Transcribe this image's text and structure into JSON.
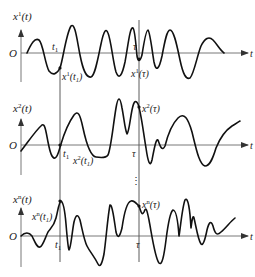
{
  "panels": [
    {
      "ylabel": "x",
      "ylabel_sup": "1",
      "ylabel_arg": "(t)",
      "origin": "O",
      "xaxis": "t",
      "t1_label": "t",
      "t1_sub": "1",
      "tau_label": "τ",
      "value_t1": "x",
      "value_t1_sup": "1",
      "value_t1_arg": "(t",
      "value_t1_argsub": "1",
      "value_t1_close": ")",
      "value_tau": "x",
      "value_tau_sup": "1",
      "value_tau_arg": "(τ)"
    },
    {
      "ylabel": "x",
      "ylabel_sup": "2",
      "ylabel_arg": "(t)",
      "origin": "O",
      "xaxis": "t",
      "t1_label": "t",
      "t1_sub": "1",
      "tau_label": "τ",
      "value_t1": "x",
      "value_t1_sup": "2",
      "value_t1_arg": "(t",
      "value_t1_argsub": "1",
      "value_t1_close": ")",
      "value_tau": "x",
      "value_tau_sup": "2",
      "value_tau_arg": "(τ)"
    },
    {
      "ylabel": "x",
      "ylabel_sup": "n",
      "ylabel_arg": "(t)",
      "origin": "O",
      "xaxis": "t",
      "t1_label": "t",
      "t1_sub": "1",
      "tau_label": "τ",
      "value_t1": "x",
      "value_t1_sup": "n",
      "value_t1_arg": "(t",
      "value_t1_argsub": "1",
      "value_t1_close": ")",
      "value_tau": "x",
      "value_tau_sup": "n",
      "value_tau_arg": "(τ)"
    }
  ],
  "ellipsis": "⋮"
}
